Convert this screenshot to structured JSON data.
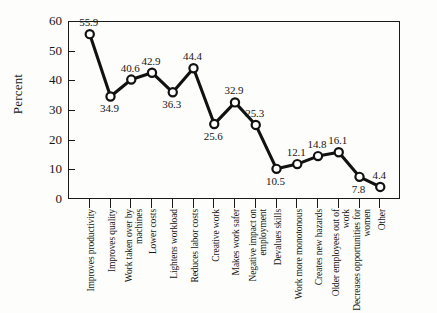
{
  "chart_data": {
    "type": "line",
    "title": "",
    "subtitle": "",
    "xlabel": "",
    "ylabel": "Percent",
    "ylim": [
      0,
      60
    ],
    "yticks": [
      0,
      10,
      20,
      30,
      40,
      50,
      60
    ],
    "grid": false,
    "legend": null,
    "marker": "open-circle",
    "data_labels": true,
    "categories": [
      "Improves productivity",
      "Improves quality",
      "Work taken over by machines",
      "Lower costs",
      "Lightens workload",
      "Reduces labor costs",
      "Creative work",
      "Makes work safer",
      "Negative impact on employment",
      "Devalues skills",
      "Work more monotonous",
      "Creates new hazards",
      "Older employees out of work",
      "Decreases opportunities for women",
      "Other"
    ],
    "values": [
      55.9,
      34.9,
      40.6,
      42.9,
      36.3,
      44.4,
      25.6,
      32.9,
      25.3,
      10.5,
      12.1,
      14.8,
      16.1,
      7.8,
      4.4
    ],
    "value_labels": [
      "55.9",
      "34.9",
      "40.6",
      "42.9",
      "36.3",
      "44.4",
      "25.6",
      "32.9",
      "25.3",
      "10.5",
      "12.1",
      "14.8",
      "16.1",
      "7.8",
      "4.4"
    ],
    "label_positions": [
      "above",
      "below",
      "above",
      "above",
      "below",
      "above",
      "below",
      "above",
      "above",
      "below",
      "above",
      "above",
      "above",
      "below",
      "above"
    ],
    "colors": {
      "line": "#111111",
      "marker_fill": "#ffffff",
      "marker_stroke": "#111111",
      "axis": "#1a1a1a",
      "text": "#161616",
      "background": "#fdfdfb"
    }
  },
  "axis": {
    "y_title": "Percent",
    "y_tick_labels": [
      "60",
      "50",
      "40",
      "30",
      "20",
      "10",
      "0"
    ]
  }
}
